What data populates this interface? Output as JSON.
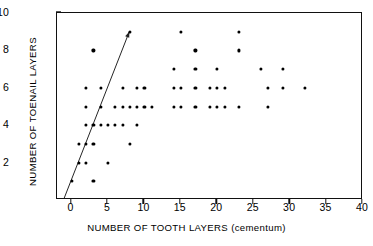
{
  "chart_data": {
    "type": "scatter",
    "title": "",
    "xlabel": "NUMBER OF TOOTH LAYERS (cementum)",
    "ylabel": "NUMBER OF TOENAIL LAYERS",
    "xlim": [
      -2,
      40
    ],
    "ylim": [
      0,
      10
    ],
    "xticks": [
      0,
      5,
      10,
      15,
      20,
      25,
      30,
      35,
      40
    ],
    "xticklabels": [
      "0",
      "5",
      "10",
      "15",
      "20",
      "25",
      "30",
      "35",
      "40"
    ],
    "yticks": [
      2,
      4,
      6,
      8,
      10
    ],
    "yticklabels": [
      "2",
      "4",
      "6",
      "8",
      "10"
    ],
    "yminorticks": [
      1,
      3,
      5,
      7,
      9
    ],
    "grid": false,
    "legend": null,
    "marker": "filled-circle",
    "marker_color": "#000000",
    "points": [
      [
        8,
        9
      ],
      [
        15,
        9
      ],
      [
        23,
        9
      ],
      [
        3,
        8
      ],
      [
        17,
        8
      ],
      [
        23,
        8
      ],
      [
        14,
        7
      ],
      [
        17,
        7
      ],
      [
        20,
        7
      ],
      [
        26,
        7
      ],
      [
        29,
        7
      ],
      [
        2,
        6
      ],
      [
        4,
        6
      ],
      [
        7,
        6
      ],
      [
        9,
        6
      ],
      [
        10,
        6
      ],
      [
        14,
        6
      ],
      [
        15,
        6
      ],
      [
        17,
        6
      ],
      [
        19,
        6
      ],
      [
        20,
        6
      ],
      [
        21,
        6
      ],
      [
        27,
        6
      ],
      [
        29,
        6
      ],
      [
        32,
        6
      ],
      [
        2,
        5
      ],
      [
        4,
        5
      ],
      [
        6,
        5
      ],
      [
        7,
        5
      ],
      [
        8,
        5
      ],
      [
        9,
        5
      ],
      [
        10,
        5
      ],
      [
        11,
        5
      ],
      [
        14,
        5
      ],
      [
        15,
        5
      ],
      [
        17,
        5
      ],
      [
        19,
        5
      ],
      [
        20,
        5
      ],
      [
        21,
        5
      ],
      [
        23,
        5
      ],
      [
        27,
        5
      ],
      [
        2,
        4
      ],
      [
        3,
        4
      ],
      [
        4,
        4
      ],
      [
        5,
        4
      ],
      [
        6,
        4
      ],
      [
        7,
        4
      ],
      [
        9,
        4
      ],
      [
        1,
        3
      ],
      [
        2,
        3
      ],
      [
        3,
        3
      ],
      [
        8,
        3
      ],
      [
        1,
        2
      ],
      [
        2,
        2
      ],
      [
        5,
        2
      ],
      [
        0,
        1
      ],
      [
        3,
        1
      ]
    ],
    "trendline": {
      "type": "line",
      "x": [
        -1,
        8
      ],
      "y": [
        0,
        9
      ],
      "color": "#222222"
    }
  },
  "axes": {
    "frame_color": "#111111"
  }
}
